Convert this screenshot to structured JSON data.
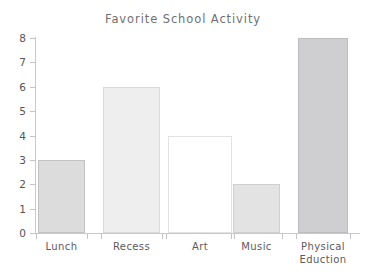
{
  "chart_data": {
    "type": "bar",
    "title": "Favorite School Activity",
    "xlabel": "",
    "ylabel": "",
    "categories": [
      "Lunch",
      "Recess",
      "Art",
      "Music",
      "Physical Eduction"
    ],
    "values": [
      3,
      6,
      4,
      2,
      8
    ],
    "ylim": [
      0,
      8
    ],
    "y_ticks": [
      "0",
      "1",
      "2",
      "3",
      "4",
      "5",
      "6",
      "7",
      "8"
    ],
    "grid": false,
    "legend": null,
    "bar_styles": [
      {
        "category": "Lunch",
        "fill": "#dcdcdd",
        "border": "#c3c3c5",
        "filled": true
      },
      {
        "category": "Recess",
        "fill": "#eeeeef",
        "border": "#dadadb",
        "filled": true
      },
      {
        "category": "Art",
        "fill": "#ffffff",
        "border": "#e2e2e3",
        "filled": false
      },
      {
        "category": "Music",
        "fill": "#e3e3e4",
        "border": "#cfcfd1",
        "filled": true
      },
      {
        "category": "Physical Eduction",
        "fill": "#cfcfd1",
        "border": "#bcbcbe",
        "filled": true
      }
    ],
    "colors": {
      "background": "#ffffff",
      "axis": "#c9c9cc",
      "title_text": "#6f6f73",
      "tick_text": "#55555a",
      "category_text": "#5a5a5f"
    }
  }
}
